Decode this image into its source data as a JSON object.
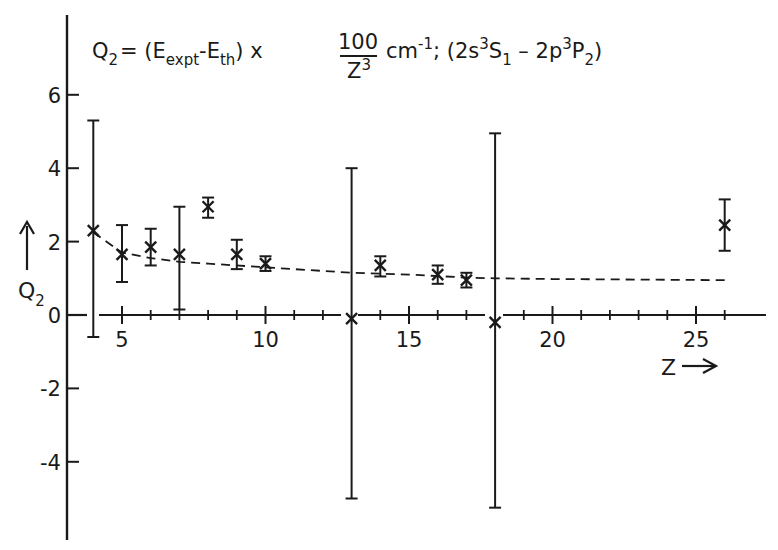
{
  "chart_data": {
    "type": "scatter",
    "title": {
      "lhs": "Q",
      "lhs_sub": "2",
      "eq": "= (E",
      "expt_sub": "expt",
      "minus": "-E",
      "th_sub": "th",
      "times": ") x",
      "frac_num": "100",
      "frac_den": "Z",
      "frac_den_sup": "3",
      "units": "cm",
      "units_sup": "-1",
      "transition_open": "; (2s",
      "t1_sup": "3",
      "t1_letter": "S",
      "t1_sub": "1",
      "t_mid": " – 2p",
      "t2_sup": "3",
      "t2_letter": "P",
      "t2_sub": "2",
      "t_close": ")",
      "full": "Q2 = (E_expt - E_th) x 100/Z^3 cm^-1 ; (2s 3S1 - 2p 3P2)"
    },
    "xlabel": "Z →",
    "ylabel": "Q2 ↑",
    "ylabel_parts": {
      "arrow": "↑",
      "letter": "Q",
      "sub": "2"
    },
    "xlabel_parts": {
      "letter": "Z",
      "arrow": "⟶"
    },
    "xlim": [
      2.4,
      28.5
    ],
    "ylim": [
      -6.2,
      8.2
    ],
    "x_ticks_major": [
      5,
      10,
      15,
      20,
      25
    ],
    "x_ticks_major_labels": [
      "5",
      "10",
      "15",
      "20",
      "25"
    ],
    "x_ticks_minor": [
      6,
      7,
      8,
      9,
      11,
      12,
      14,
      16,
      17,
      18,
      19,
      21,
      22,
      23,
      24,
      26
    ],
    "y_ticks": [
      6,
      4,
      2,
      0,
      -2,
      -4
    ],
    "y_ticks_labels": [
      "6",
      "4",
      "2",
      "0",
      "-2",
      "-4"
    ],
    "grid": false,
    "legend": null,
    "series": [
      {
        "name": "Experiment vs theory (Q2) with error bars",
        "marker": "x",
        "points": [
          {
            "z": 4,
            "q": 2.3,
            "err_low": -0.6,
            "err_high": 5.3
          },
          {
            "z": 5,
            "q": 1.65,
            "err_low": 0.9,
            "err_high": 2.45
          },
          {
            "z": 6,
            "q": 1.85,
            "err_low": 1.35,
            "err_high": 2.35
          },
          {
            "z": 7,
            "q": 1.65,
            "err_low": 0.15,
            "err_high": 2.95
          },
          {
            "z": 8,
            "q": 2.95,
            "err_low": 2.65,
            "err_high": 3.2
          },
          {
            "z": 9,
            "q": 1.65,
            "err_low": 1.25,
            "err_high": 2.05
          },
          {
            "z": 10,
            "q": 1.4,
            "err_low": 1.2,
            "err_high": 1.6
          },
          {
            "z": 13,
            "q": -0.1,
            "err_low": -5.0,
            "err_high": 4.0
          },
          {
            "z": 14,
            "q": 1.35,
            "err_low": 1.05,
            "err_high": 1.6
          },
          {
            "z": 16,
            "q": 1.1,
            "err_low": 0.85,
            "err_high": 1.35
          },
          {
            "z": 17,
            "q": 0.95,
            "err_low": 0.75,
            "err_high": 1.15
          },
          {
            "z": 18,
            "q": -0.2,
            "err_low": -5.25,
            "err_high": 4.95
          },
          {
            "z": 26,
            "q": 2.45,
            "err_low": 1.75,
            "err_high": 3.15
          }
        ]
      },
      {
        "name": "Fitted trend (dashed)",
        "style": "dashed",
        "x": [
          4,
          5,
          6,
          7,
          8,
          10,
          13,
          15,
          17,
          18,
          20,
          26
        ],
        "y": [
          2.25,
          1.7,
          1.55,
          1.45,
          1.4,
          1.3,
          1.15,
          1.1,
          1.02,
          1.0,
          0.98,
          0.95
        ]
      }
    ],
    "colors": {
      "ink": "#1a1a1a",
      "background": "#ffffff"
    }
  }
}
